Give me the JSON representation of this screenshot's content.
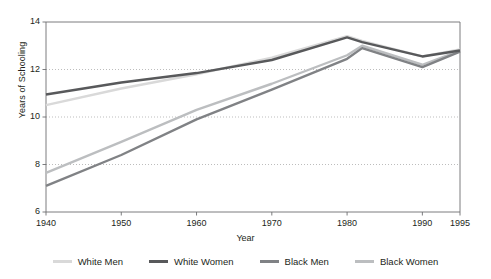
{
  "chart_data": {
    "type": "line",
    "title": "",
    "xlabel": "Year",
    "ylabel": "Years of Schooling",
    "xlim": [
      1940,
      1995
    ],
    "ylim": [
      6,
      14
    ],
    "yticks": [
      6,
      8,
      10,
      12,
      14
    ],
    "xticks": [
      1940,
      1950,
      1960,
      1970,
      1980,
      1990,
      1995
    ],
    "grid": "horizontal-dotted",
    "legend_position": "bottom",
    "x": [
      1940,
      1950,
      1960,
      1970,
      1980,
      1982,
      1990,
      1995
    ],
    "series": [
      {
        "name": "White Men",
        "color": "#d9d9d9",
        "values": [
          10.5,
          11.2,
          11.8,
          12.5,
          13.4,
          13.2,
          12.55,
          12.85
        ]
      },
      {
        "name": "White Women",
        "color": "#58595b",
        "values": [
          10.95,
          11.45,
          11.85,
          12.4,
          13.35,
          13.15,
          12.55,
          12.8
        ]
      },
      {
        "name": "Black Men",
        "color": "#808285",
        "values": [
          7.1,
          8.4,
          9.9,
          11.15,
          12.45,
          12.9,
          12.1,
          12.75
        ]
      },
      {
        "name": "Black Women",
        "color": "#bcbec0",
        "values": [
          7.65,
          8.95,
          10.3,
          11.4,
          12.6,
          13.0,
          12.2,
          12.8
        ]
      }
    ]
  },
  "axes": {
    "y_title": "Years of Schooling",
    "x_title": "Year",
    "y_tick_labels": [
      "14",
      "12",
      "10",
      "8",
      "6"
    ],
    "x_tick_labels": [
      "1940",
      "1950",
      "1960",
      "1970",
      "1980",
      "1990",
      "1995"
    ]
  },
  "legend": {
    "items": [
      {
        "label": "White Men",
        "color": "#d9d9d9"
      },
      {
        "label": "White Women",
        "color": "#58595b"
      },
      {
        "label": "Black Men",
        "color": "#808285"
      },
      {
        "label": "Black Women",
        "color": "#bcbec0"
      }
    ]
  }
}
